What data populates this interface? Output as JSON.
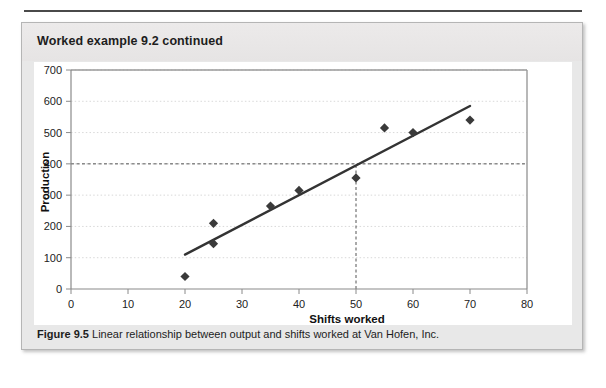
{
  "card": {
    "header_title": "Worked example 9.2 continued",
    "caption_label": "Figure 9.5",
    "caption_text": "Linear relationship between output and shifts worked at Van Hofen, Inc."
  },
  "colors": {
    "card_background": "#e8e8e8",
    "card_border": "#b5b5b5",
    "panel_background": "#ffffff",
    "marker": "#3a3a3a",
    "trendline": "#333333",
    "gridline": "#d9d9d9",
    "reference_line": "#555555",
    "axis": "#9a9a9a",
    "text": "#1d1d1d"
  },
  "chart_data": {
    "type": "scatter",
    "title": "",
    "xlabel": "Shifts worked",
    "ylabel": "Production",
    "xlim": [
      0,
      80
    ],
    "ylim": [
      0,
      700
    ],
    "xticks": [
      0,
      10,
      20,
      30,
      40,
      50,
      60,
      70,
      80
    ],
    "yticks": [
      0,
      100,
      200,
      300,
      400,
      500,
      600,
      700
    ],
    "grid": true,
    "grid_axis": "y",
    "legend": "none",
    "points": [
      {
        "x": 20,
        "y": 40
      },
      {
        "x": 25,
        "y": 145
      },
      {
        "x": 25,
        "y": 210
      },
      {
        "x": 35,
        "y": 265
      },
      {
        "x": 40,
        "y": 315
      },
      {
        "x": 50,
        "y": 355
      },
      {
        "x": 55,
        "y": 515
      },
      {
        "x": 60,
        "y": 500
      },
      {
        "x": 70,
        "y": 540
      }
    ],
    "series": [
      {
        "name": "Production observations",
        "x": [
          20,
          25,
          25,
          35,
          40,
          50,
          55,
          60,
          70
        ],
        "values": [
          40,
          145,
          210,
          265,
          315,
          355,
          515,
          500,
          540
        ]
      }
    ],
    "trendline": {
      "name": "Least squares regression line",
      "x_start": 20,
      "y_start": 110,
      "x_end": 70,
      "y_end": 585
    },
    "annotations": [
      {
        "name": "horizontal-reference-line",
        "type": "hline",
        "y": 400,
        "style": "dashed",
        "x_start": 0,
        "x_end": 80
      },
      {
        "name": "vertical-reference-line",
        "type": "vline",
        "x": 50,
        "style": "dashed",
        "y_start": 0,
        "y_end": 400
      }
    ]
  }
}
